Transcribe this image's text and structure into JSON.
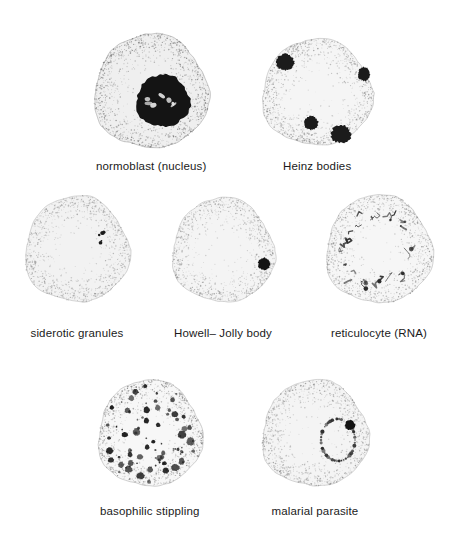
{
  "plate": {
    "title": "Red blood cell inclusions",
    "background_color": "#ffffff",
    "ink_color": "#1a1a1a",
    "caption_font_size_px": 11.5,
    "rows": [
      2,
      3,
      2
    ]
  },
  "figures": [
    {
      "id": "normoblast",
      "label": "normoblast (nucleus)",
      "row": 1,
      "column": 1,
      "cell": {
        "center_x": 151,
        "center_y": 92,
        "radius_x": 57,
        "radius_y": 57,
        "rim_tone": "#6e6e6e",
        "body_tone": "#efefef",
        "shading": "heavy-stipple-ring"
      },
      "inclusions": [
        {
          "kind": "nucleus",
          "count": 1,
          "center_x": 163,
          "center_y": 101,
          "radius_x": 27,
          "radius_y": 26,
          "color": "#141414",
          "note": "dense round nucleus offset toward lower right, with pale chromatin highlights"
        }
      ]
    },
    {
      "id": "heinz-bodies",
      "label": "Heinz bodies",
      "row": 1,
      "column": 2,
      "cell": {
        "center_x": 317,
        "center_y": 93,
        "radius_x": 55,
        "radius_y": 53,
        "rim_tone": "#8a8a8a",
        "body_tone": "#f5f5f5",
        "shading": "light-stipple"
      },
      "inclusions": [
        {
          "kind": "heinz-body",
          "center_x": 285,
          "center_y": 62,
          "radius_x": 9,
          "radius_y": 8,
          "color": "#1b1b1b"
        },
        {
          "kind": "heinz-body",
          "center_x": 364,
          "center_y": 74,
          "radius_x": 6,
          "radius_y": 7,
          "color": "#1b1b1b"
        },
        {
          "kind": "heinz-body",
          "center_x": 311,
          "center_y": 123,
          "radius_x": 7,
          "radius_y": 7,
          "color": "#1b1b1b"
        },
        {
          "kind": "heinz-body",
          "center_x": 341,
          "center_y": 134,
          "radius_x": 10,
          "radius_y": 9,
          "color": "#1b1b1b"
        }
      ]
    },
    {
      "id": "siderotic-granules",
      "label": "siderotic granules",
      "row": 2,
      "column": 1,
      "cell": {
        "center_x": 77,
        "center_y": 250,
        "radius_x": 52,
        "radius_y": 53,
        "rim_tone": "#8f8f8f",
        "body_tone": "#f2f2f2",
        "shading": "light-stipple-lobed"
      },
      "inclusions": [
        {
          "kind": "granule-cluster",
          "count": 6,
          "center_x": 105,
          "center_y": 239,
          "radius_x": 8,
          "radius_y": 7,
          "color": "#1b1b1b",
          "note": "tiny punctate granules clustered upper right"
        }
      ]
    },
    {
      "id": "howell-jolly-body",
      "label": "Howell– Jolly body",
      "row": 2,
      "column": 2,
      "cell": {
        "center_x": 223,
        "center_y": 251,
        "radius_x": 51,
        "radius_y": 52,
        "rim_tone": "#909090",
        "body_tone": "#f4f4f4",
        "shading": "light-stipple"
      },
      "inclusions": [
        {
          "kind": "howell-jolly-body",
          "count": 1,
          "center_x": 264,
          "center_y": 264,
          "radius_x": 6,
          "radius_y": 6,
          "color": "#141414",
          "note": "single round dark inclusion near right margin"
        }
      ]
    },
    {
      "id": "reticulocyte",
      "label": "reticulocyte (RNA)",
      "row": 2,
      "column": 3,
      "cell": {
        "center_x": 379,
        "center_y": 250,
        "radius_x": 53,
        "radius_y": 54,
        "rim_tone": "#8a8a8a",
        "body_tone": "#f6f6f6",
        "shading": "light-stipple"
      },
      "inclusions": [
        {
          "kind": "reticular-network",
          "count": 34,
          "ring_radius": 40,
          "color": "#2a2a2a",
          "note": "filamentous RNA reticulum forming a broken ring inside the periphery"
        }
      ]
    },
    {
      "id": "basophilic-stippling",
      "label": "basophilic stippling",
      "row": 3,
      "column": 1,
      "cell": {
        "center_x": 150,
        "center_y": 434,
        "radius_x": 52,
        "radius_y": 53,
        "rim_tone": "#7d7d7d",
        "body_tone": "#f7f7f7",
        "shading": "light-stipple"
      },
      "inclusions": [
        {
          "kind": "basophilic-stipple",
          "count": 86,
          "color": "#1d1d1d",
          "note": "numerous coarse dark dots of varying size scattered across the whole cell"
        }
      ]
    },
    {
      "id": "malarial-parasite",
      "label": "malarial parasite",
      "row": 3,
      "column": 2,
      "cell": {
        "center_x": 315,
        "center_y": 434,
        "radius_x": 53,
        "radius_y": 53,
        "rim_tone": "#8c8c8c",
        "body_tone": "#f4f4f4",
        "shading": "light-stipple"
      },
      "inclusions": [
        {
          "kind": "ring-trophozoite",
          "count": 1,
          "center_x": 338,
          "center_y": 440,
          "radius_x": 17,
          "radius_y": 21,
          "color": "#2b2b2b",
          "note": "dotted ring form with dense chromatin dot at upper right of the ring"
        },
        {
          "kind": "chromatin-dot",
          "center_x": 350,
          "center_y": 425,
          "radius_x": 5,
          "radius_y": 5,
          "color": "#141414"
        }
      ]
    }
  ],
  "captions": [
    {
      "text": "normoblast (nucleus)",
      "center_x": 151,
      "y": 160
    },
    {
      "text": "Heinz bodies",
      "center_x": 317,
      "y": 160
    },
    {
      "text": "siderotic granules",
      "center_x": 77,
      "y": 327
    },
    {
      "text": "Howell– Jolly body",
      "center_x": 223,
      "y": 327
    },
    {
      "text": "reticulocyte (RNA)",
      "center_x": 379,
      "y": 327
    },
    {
      "text": "basophilic stippling",
      "center_x": 150,
      "y": 505
    },
    {
      "text": "malarial parasite",
      "center_x": 315,
      "y": 505
    }
  ]
}
